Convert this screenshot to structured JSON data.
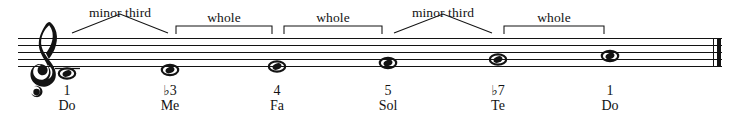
{
  "figure": {
    "clef": "treble-clef",
    "staff_lines": 5,
    "end_barline": "thin-thick-double-barline",
    "ink_color": "#131313",
    "background_color": "#ffffff"
  },
  "notes": [
    {
      "id": "note-1",
      "degree": "1",
      "solfege": "Do",
      "x": 67,
      "pitch": "C4",
      "ledger": true,
      "head": "whole-note"
    },
    {
      "id": "note-2",
      "degree": "♭3",
      "solfege": "Me",
      "x": 170,
      "pitch": "E♭4",
      "ledger": false,
      "head": "whole-note"
    },
    {
      "id": "note-3",
      "degree": "4",
      "solfege": "Fa",
      "x": 277,
      "pitch": "F4",
      "ledger": false,
      "head": "whole-note"
    },
    {
      "id": "note-4",
      "degree": "5",
      "solfege": "Sol",
      "x": 388,
      "pitch": "G4",
      "ledger": false,
      "head": "whole-note"
    },
    {
      "id": "note-5",
      "degree": "♭7",
      "solfege": "Te",
      "x": 498,
      "pitch": "B♭4",
      "ledger": false,
      "head": "whole-note"
    },
    {
      "id": "note-6",
      "degree": "1",
      "solfege": "Do",
      "x": 610,
      "pitch": "C5",
      "ledger": false,
      "head": "whole-note"
    }
  ],
  "intervals": [
    {
      "id": "interval-1",
      "label": "minor third",
      "shape": "peak",
      "from_x": 72,
      "to_x": 168,
      "label_x": 120,
      "label_y": 6
    },
    {
      "id": "interval-2",
      "label": "whole",
      "shape": "square",
      "from_x": 176,
      "to_x": 272,
      "label_x": 224,
      "label_y": 15
    },
    {
      "id": "interval-3",
      "label": "whole",
      "shape": "square",
      "from_x": 284,
      "to_x": 382,
      "label_x": 333,
      "label_y": 15
    },
    {
      "id": "interval-4",
      "label": "minor third",
      "shape": "peak",
      "from_x": 394,
      "to_x": 492,
      "label_x": 443,
      "label_y": 6
    },
    {
      "id": "interval-5",
      "label": "whole",
      "shape": "square",
      "from_x": 504,
      "to_x": 604,
      "label_x": 554,
      "label_y": 15
    }
  ],
  "labels": {
    "degree_row_y": 84,
    "solfege_row_y": 99
  }
}
